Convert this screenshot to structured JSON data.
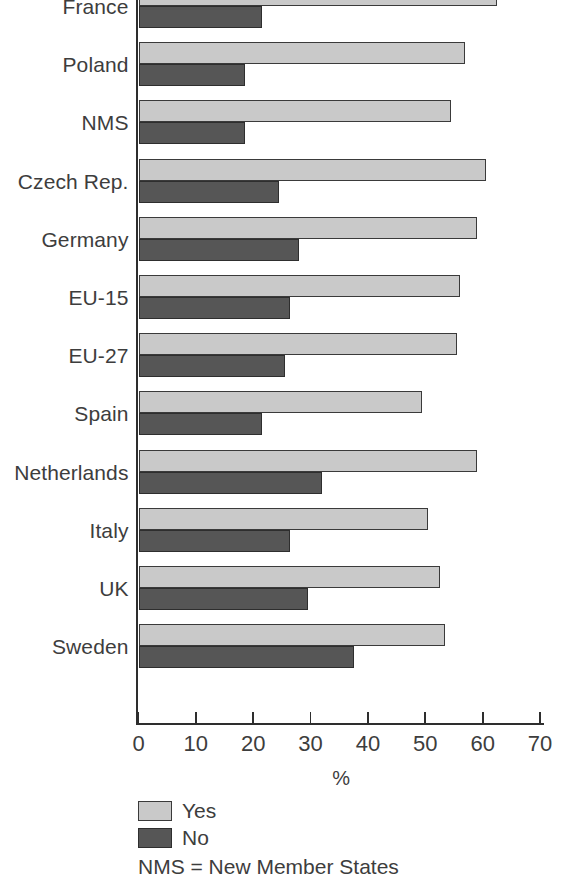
{
  "chart_data": {
    "type": "bar",
    "orientation": "horizontal",
    "grouped": true,
    "title": "",
    "xlabel": "%",
    "ylabel": "",
    "xlim": [
      0,
      70
    ],
    "xticks": [
      0,
      10,
      20,
      30,
      40,
      50,
      60,
      70
    ],
    "xtick_labels": [
      "0",
      "10",
      "20",
      "30",
      "40",
      "50",
      "60",
      "70"
    ],
    "grid": false,
    "legend_position": "bottom-left",
    "categories": [
      "France",
      "Poland",
      "NMS",
      "Czech Rep.",
      "Germany",
      "EU-15",
      "EU-27",
      "Spain",
      "Netherlands",
      "Italy",
      "UK",
      "Sweden"
    ],
    "series": [
      {
        "name": "Yes",
        "color": "#c9c9c9",
        "values": [
          62.5,
          57,
          54.5,
          60.5,
          59,
          56,
          55.5,
          49.5,
          59,
          50.5,
          52.5,
          53.5
        ]
      },
      {
        "name": "No",
        "color": "#565656",
        "values": [
          21.5,
          18.5,
          18.5,
          24.5,
          28,
          26.5,
          25.5,
          21.5,
          32,
          26.5,
          29.5,
          37.5
        ]
      }
    ],
    "note": "NMS = New Member States"
  },
  "legend": {
    "items": [
      {
        "label": "Yes",
        "color": "#c9c9c9"
      },
      {
        "label": "No",
        "color": "#565656"
      }
    ],
    "note": "NMS = New Member States"
  },
  "axis": {
    "x_title": "%"
  }
}
